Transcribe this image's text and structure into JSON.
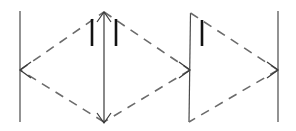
{
  "canvas": {
    "width": 296,
    "height": 131,
    "background": "#ffffff",
    "title": "Geometric line diagram with dashed diamond and triangle between vertical bars"
  },
  "style": {
    "solid_stroke": "#4a4a4a",
    "solid_width": 1.2,
    "dashed_stroke": "#6b6b6b",
    "dashed_width": 1.6,
    "dash_pattern": "9 7",
    "tick_stroke": "#121212",
    "tick_width": 2.6,
    "arrow_stroke": "#3a3a3a",
    "arrow_width": 1.2
  },
  "chart_data": {
    "type": "diagram",
    "xlabel": "",
    "ylabel": "",
    "grid": false,
    "legend": "none"
  },
  "vertical_lines": [
    {
      "name": "vertical-line-1",
      "x1": 20,
      "y1": 11,
      "x2": 20,
      "y2": 122
    },
    {
      "name": "vertical-line-2",
      "x1": 190.5,
      "y1": 13,
      "x2": 189,
      "y2": 122
    },
    {
      "name": "vertical-line-3",
      "x1": 278,
      "y1": 11,
      "x2": 278,
      "y2": 122
    }
  ],
  "center_arrow": {
    "name": "center-double-arrow",
    "x": 104,
    "y_top": 12,
    "y_bottom": 123,
    "head_half_width": 7,
    "head_length": 10
  },
  "diamond": {
    "name": "dashed-diamond",
    "left": {
      "x": 20,
      "y": 70
    },
    "top": {
      "x": 104,
      "y": 12
    },
    "right": {
      "x": 190,
      "y": 70
    },
    "bottom": {
      "x": 104,
      "y": 122
    }
  },
  "triangle": {
    "name": "dashed-triangle",
    "apex_top": {
      "x": 190.5,
      "y": 13
    },
    "apex_bottom": {
      "x": 189,
      "y": 122
    },
    "point_right": {
      "x": 278,
      "y": 70
    }
  },
  "arrowheads": [
    {
      "name": "arrowhead-left",
      "x": 20,
      "y": 70,
      "direction": "left"
    },
    {
      "name": "arrowhead-middle-right",
      "x": 190,
      "y": 70,
      "direction": "right"
    },
    {
      "name": "arrowhead-far-right",
      "x": 278,
      "y": 70,
      "direction": "right"
    }
  ],
  "tick_marks": [
    {
      "name": "tick-mark-1",
      "x": 92,
      "y_top": 19,
      "y_bottom": 46
    },
    {
      "name": "tick-mark-2",
      "x": 116,
      "y_top": 19,
      "y_bottom": 46
    },
    {
      "name": "tick-mark-3",
      "x": 202,
      "y_top": 20,
      "y_bottom": 46
    }
  ]
}
